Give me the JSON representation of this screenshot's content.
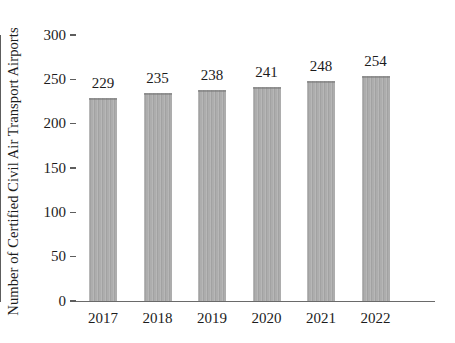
{
  "chart_data": {
    "type": "bar",
    "title": "",
    "subtitle": "",
    "xlabel": "",
    "ylabel": "Number of Certified Civil Air Transport Airports",
    "categories": [
      "2017",
      "2018",
      "2019",
      "2020",
      "2021",
      "2022"
    ],
    "values": [
      229,
      235,
      238,
      241,
      248,
      254
    ],
    "value_labels": [
      "229",
      "235",
      "238",
      "241",
      "248",
      "254"
    ],
    "series": [
      {
        "name": "Certified Civil Air Transport Airports",
        "values": [
          229,
          235,
          238,
          241,
          248,
          254
        ]
      }
    ],
    "ylim": [
      0,
      300
    ],
    "ytick_values": [
      0,
      50,
      100,
      150,
      200,
      250,
      300
    ],
    "ytick_labels": [
      "0",
      "50",
      "100",
      "150",
      "200",
      "250",
      "300"
    ],
    "grid": false,
    "legend": false,
    "legend_position": "none",
    "bar_color": "#a9a9a9",
    "axis_color": "#5d5d5d",
    "text_color": "#1c1c1c",
    "background_color": "#ffffff",
    "data_labels_shown": true,
    "data_label_position": "above-bar",
    "ytick_direction": "outward",
    "xtick_marks": false
  }
}
